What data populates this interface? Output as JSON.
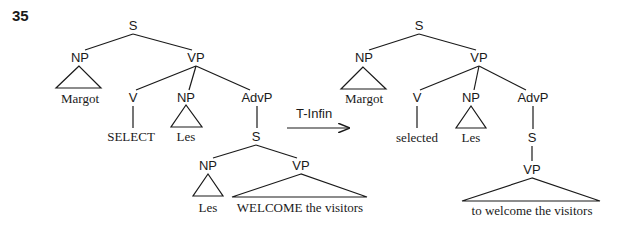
{
  "figure_number": "35",
  "transformation": {
    "label": "T-Infin",
    "arrow": {
      "x1": 287,
      "y1": 128,
      "x2": 349,
      "y2": 128
    },
    "label_pos": {
      "x": 296,
      "y": 118
    }
  },
  "trees": [
    {
      "name": "before",
      "nodes": [
        {
          "id": "S",
          "text": "S",
          "x": 133,
          "y": 30,
          "kind": "label"
        },
        {
          "id": "NP1",
          "text": "NP",
          "x": 80,
          "y": 62,
          "kind": "label"
        },
        {
          "id": "VP",
          "text": "VP",
          "x": 196,
          "y": 62,
          "kind": "label"
        },
        {
          "id": "Margot",
          "text": "Margot",
          "x": 80,
          "y": 103,
          "kind": "leaf"
        },
        {
          "id": "V",
          "text": "V",
          "x": 133,
          "y": 102,
          "kind": "label"
        },
        {
          "id": "NP2",
          "text": "NP",
          "x": 186,
          "y": 102,
          "kind": "label"
        },
        {
          "id": "AdvP",
          "text": "AdvP",
          "x": 257,
          "y": 102,
          "kind": "label"
        },
        {
          "id": "SELECT",
          "text": "SELECT",
          "x": 131,
          "y": 141,
          "kind": "leaf"
        },
        {
          "id": "Les1",
          "text": "Les",
          "x": 186,
          "y": 141,
          "kind": "leaf"
        },
        {
          "id": "S2",
          "text": "S",
          "x": 256,
          "y": 141,
          "kind": "label"
        },
        {
          "id": "NP3",
          "text": "NP",
          "x": 208,
          "y": 170,
          "kind": "label"
        },
        {
          "id": "VP2",
          "text": "VP",
          "x": 301,
          "y": 170,
          "kind": "label"
        },
        {
          "id": "Les2",
          "text": "Les",
          "x": 208,
          "y": 212,
          "kind": "leaf"
        },
        {
          "id": "WELCOME",
          "text": "WELCOME the visitors",
          "x": 300,
          "y": 212,
          "kind": "leaf"
        }
      ],
      "edges": [
        {
          "x1": 133,
          "y1": 34,
          "x2": 85,
          "y2": 50
        },
        {
          "x1": 133,
          "y1": 34,
          "x2": 192,
          "y2": 50
        },
        {
          "x1": 196,
          "y1": 66,
          "x2": 136,
          "y2": 90
        },
        {
          "x1": 196,
          "y1": 66,
          "x2": 189,
          "y2": 90
        },
        {
          "x1": 196,
          "y1": 66,
          "x2": 250,
          "y2": 90
        },
        {
          "x1": 133,
          "y1": 106,
          "x2": 133,
          "y2": 128
        },
        {
          "x1": 257,
          "y1": 106,
          "x2": 257,
          "y2": 128
        },
        {
          "x1": 256,
          "y1": 145,
          "x2": 213,
          "y2": 158
        },
        {
          "x1": 256,
          "y1": 145,
          "x2": 297,
          "y2": 158
        }
      ],
      "triangles": [
        {
          "apex": [
            79,
            66
          ],
          "left": [
            56,
            88
          ],
          "right": [
            101,
            88
          ]
        },
        {
          "apex": [
            186,
            105
          ],
          "left": [
            171,
            127
          ],
          "right": [
            202,
            127
          ]
        },
        {
          "apex": [
            208,
            174
          ],
          "left": [
            193,
            196
          ],
          "right": [
            223,
            196
          ]
        },
        {
          "apex": [
            301,
            174
          ],
          "left": [
            232,
            197
          ],
          "right": [
            367,
            197
          ]
        }
      ]
    },
    {
      "name": "after",
      "nodes": [
        {
          "id": "S",
          "text": "S",
          "x": 419,
          "y": 30,
          "kind": "label"
        },
        {
          "id": "NP1",
          "text": "NP",
          "x": 364,
          "y": 62,
          "kind": "label"
        },
        {
          "id": "VP",
          "text": "VP",
          "x": 479,
          "y": 62,
          "kind": "label"
        },
        {
          "id": "Margot",
          "text": "Margot",
          "x": 364,
          "y": 103,
          "kind": "leaf"
        },
        {
          "id": "V",
          "text": "V",
          "x": 417,
          "y": 102,
          "kind": "label"
        },
        {
          "id": "NP2",
          "text": "NP",
          "x": 471,
          "y": 102,
          "kind": "label"
        },
        {
          "id": "AdvP",
          "text": "AdvP",
          "x": 533,
          "y": 102,
          "kind": "label"
        },
        {
          "id": "selected",
          "text": "selected",
          "x": 417,
          "y": 142,
          "kind": "leaf"
        },
        {
          "id": "Les1",
          "text": "Les",
          "x": 471,
          "y": 142,
          "kind": "leaf"
        },
        {
          "id": "S2",
          "text": "S",
          "x": 532,
          "y": 142,
          "kind": "label"
        },
        {
          "id": "VP2",
          "text": "VP",
          "x": 532,
          "y": 174,
          "kind": "label"
        },
        {
          "id": "welcome",
          "text": "to welcome the visitors",
          "x": 532,
          "y": 215,
          "kind": "leaf"
        }
      ],
      "edges": [
        {
          "x1": 419,
          "y1": 34,
          "x2": 369,
          "y2": 50
        },
        {
          "x1": 419,
          "y1": 34,
          "x2": 476,
          "y2": 50
        },
        {
          "x1": 479,
          "y1": 66,
          "x2": 420,
          "y2": 90
        },
        {
          "x1": 479,
          "y1": 66,
          "x2": 474,
          "y2": 90
        },
        {
          "x1": 479,
          "y1": 66,
          "x2": 526,
          "y2": 90
        },
        {
          "x1": 417,
          "y1": 106,
          "x2": 417,
          "y2": 128
        },
        {
          "x1": 533,
          "y1": 106,
          "x2": 533,
          "y2": 129
        },
        {
          "x1": 532,
          "y1": 146,
          "x2": 532,
          "y2": 161
        }
      ],
      "triangles": [
        {
          "apex": [
            363,
            67
          ],
          "left": [
            341,
            89
          ],
          "right": [
            386,
            89
          ]
        },
        {
          "apex": [
            471,
            106
          ],
          "left": [
            456,
            128
          ],
          "right": [
            486,
            128
          ]
        },
        {
          "apex": [
            532,
            178
          ],
          "left": [
            462,
            201
          ],
          "right": [
            600,
            201
          ]
        }
      ]
    }
  ]
}
